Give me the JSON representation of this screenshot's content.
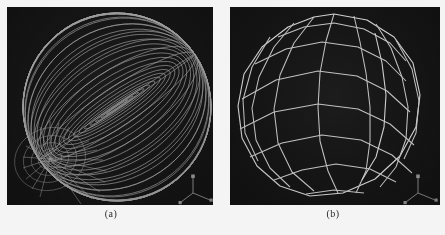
{
  "figure": {
    "background_color": "#f4f4f4",
    "panel_count": 2
  },
  "panels": [
    {
      "id": "panel-a",
      "caption": "(a)",
      "viewport_background": "#141414",
      "wireframe_color": "#b9b9b9",
      "model": "uv-sphere-fine-wireframe",
      "description": "Dense UV sphere wireframe with visible pole convergence at lower-left",
      "meridians": 24,
      "parallels": 16,
      "pole_visible": true,
      "pole_position": {
        "x": 43,
        "y": 152
      },
      "sphere_center": {
        "x": 110,
        "y": 100
      },
      "sphere_radius": 94,
      "axis_gizmo": {
        "origin": {
          "x": 186,
          "y": 186
        },
        "axes": [
          {
            "label": "Y",
            "dx": 0,
            "dy": -15
          },
          {
            "label": "X",
            "dx": 17,
            "dy": 7
          },
          {
            "label": "Z",
            "dx": -12,
            "dy": 9
          }
        ],
        "color": "#9a9a9a"
      }
    },
    {
      "id": "panel-b",
      "caption": "(b)",
      "viewport_background": "#141414",
      "wireframe_color": "#cfcfcf",
      "model": "polyhedral-sphere-coarse-wireframe",
      "description": "Coarse faceted polygonal sphere wireframe with flat quad facets",
      "meridians": 12,
      "parallels": 9,
      "pole_visible": false,
      "sphere_center": {
        "x": 104,
        "y": 100
      },
      "sphere_radius": 93,
      "axis_gizmo": {
        "origin": {
          "x": 188,
          "y": 186
        },
        "axes": [
          {
            "label": "Y",
            "dx": 0,
            "dy": -15
          },
          {
            "label": "X",
            "dx": 17,
            "dy": 7
          },
          {
            "label": "Z",
            "dx": -12,
            "dy": 9
          }
        ],
        "color": "#9a9a9a"
      }
    }
  ]
}
